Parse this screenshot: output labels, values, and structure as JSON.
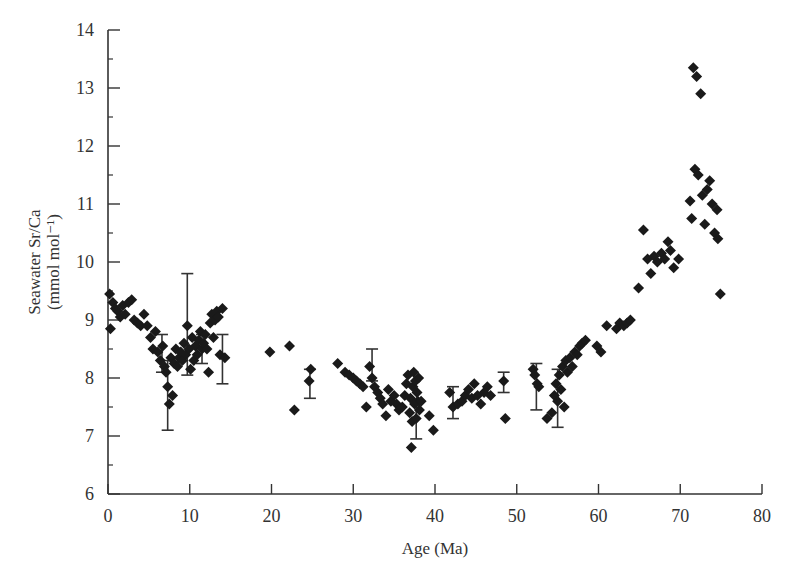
{
  "chart_data": {
    "type": "scatter",
    "title": "",
    "xlabel": "Age (Ma)",
    "ylabel_line1": "Seawater Sr/Ca",
    "ylabel_line2": "(mmol mol⁻¹)",
    "xlim": [
      0,
      80
    ],
    "ylim": [
      6,
      14
    ],
    "xticks": [
      0,
      10,
      20,
      30,
      40,
      50,
      60,
      70,
      80
    ],
    "yticks": [
      6,
      7,
      8,
      9,
      10,
      11,
      12,
      13,
      14
    ],
    "grid": false,
    "legend": null,
    "marker": "diamond",
    "marker_color": "#1a1a1a",
    "series": [
      {
        "name": "Seawater Sr/Ca",
        "points": [
          [
            0.2,
            9.45
          ],
          [
            0.3,
            8.85
          ],
          [
            0.6,
            9.3
          ],
          [
            0.9,
            9.2
          ],
          [
            1.2,
            9.15
          ],
          [
            1.5,
            9.05
          ],
          [
            1.8,
            9.25
          ],
          [
            2.1,
            9.1
          ],
          [
            2.5,
            9.3
          ],
          [
            2.9,
            9.35
          ],
          [
            3.2,
            9.0
          ],
          [
            3.6,
            8.95
          ],
          [
            4.0,
            8.9
          ],
          [
            4.4,
            9.1
          ],
          [
            4.8,
            8.9
          ],
          [
            5.2,
            8.7
          ],
          [
            5.5,
            8.5
          ],
          [
            5.8,
            8.8
          ],
          [
            6.1,
            8.45
          ],
          [
            6.4,
            8.3
          ],
          [
            6.7,
            8.55
          ],
          [
            6.9,
            8.2
          ],
          [
            7.1,
            8.1
          ],
          [
            7.3,
            7.85
          ],
          [
            7.5,
            7.55
          ],
          [
            7.7,
            8.35
          ],
          [
            7.9,
            7.7
          ],
          [
            8.1,
            8.25
          ],
          [
            8.3,
            8.5
          ],
          [
            8.5,
            8.2
          ],
          [
            8.7,
            8.35
          ],
          [
            8.9,
            8.45
          ],
          [
            9.1,
            8.3
          ],
          [
            9.3,
            8.6
          ],
          [
            9.5,
            8.4
          ],
          [
            9.7,
            8.9
          ],
          [
            9.9,
            8.5
          ],
          [
            10.1,
            8.15
          ],
          [
            10.3,
            8.7
          ],
          [
            10.5,
            8.3
          ],
          [
            10.7,
            8.55
          ],
          [
            10.9,
            8.4
          ],
          [
            11.1,
            8.65
          ],
          [
            11.3,
            8.8
          ],
          [
            11.5,
            8.5
          ],
          [
            11.7,
            8.6
          ],
          [
            11.9,
            8.75
          ],
          [
            12.1,
            8.5
          ],
          [
            12.3,
            8.1
          ],
          [
            12.5,
            8.95
          ],
          [
            12.7,
            9.1
          ],
          [
            12.9,
            8.7
          ],
          [
            13.1,
            9.0
          ],
          [
            13.3,
            9.15
          ],
          [
            13.5,
            9.05
          ],
          [
            13.7,
            8.4
          ],
          [
            14.0,
            9.2
          ],
          [
            14.3,
            8.35
          ],
          [
            19.8,
            8.45
          ],
          [
            22.2,
            8.55
          ],
          [
            22.8,
            7.45
          ],
          [
            24.6,
            7.95
          ],
          [
            24.8,
            8.15
          ],
          [
            28.1,
            8.25
          ],
          [
            29.0,
            8.1
          ],
          [
            29.5,
            8.05
          ],
          [
            30.0,
            8.0
          ],
          [
            30.4,
            7.95
          ],
          [
            30.8,
            7.9
          ],
          [
            31.2,
            7.85
          ],
          [
            31.6,
            7.5
          ],
          [
            32.0,
            8.2
          ],
          [
            32.3,
            8.0
          ],
          [
            32.6,
            7.85
          ],
          [
            33.0,
            7.75
          ],
          [
            33.3,
            7.65
          ],
          [
            33.6,
            7.55
          ],
          [
            34.0,
            7.35
          ],
          [
            34.3,
            7.8
          ],
          [
            34.6,
            7.6
          ],
          [
            35.0,
            7.7
          ],
          [
            35.3,
            7.55
          ],
          [
            35.6,
            7.45
          ],
          [
            36.0,
            7.5
          ],
          [
            36.3,
            7.7
          ],
          [
            36.5,
            7.9
          ],
          [
            36.7,
            8.05
          ],
          [
            36.9,
            7.4
          ],
          [
            37.0,
            7.65
          ],
          [
            37.1,
            6.8
          ],
          [
            37.2,
            7.25
          ],
          [
            37.3,
            7.85
          ],
          [
            37.4,
            8.1
          ],
          [
            37.5,
            7.55
          ],
          [
            37.6,
            7.95
          ],
          [
            37.7,
            7.3
          ],
          [
            37.8,
            7.75
          ],
          [
            37.9,
            7.6
          ],
          [
            38.0,
            8.0
          ],
          [
            38.1,
            7.45
          ],
          [
            38.3,
            7.6
          ],
          [
            39.3,
            7.35
          ],
          [
            39.8,
            7.1
          ],
          [
            41.8,
            7.75
          ],
          [
            42.2,
            7.5
          ],
          [
            42.8,
            7.55
          ],
          [
            43.3,
            7.6
          ],
          [
            43.7,
            7.7
          ],
          [
            44.1,
            7.8
          ],
          [
            44.5,
            7.65
          ],
          [
            44.8,
            7.9
          ],
          [
            45.2,
            7.7
          ],
          [
            45.6,
            7.55
          ],
          [
            46.0,
            7.75
          ],
          [
            46.4,
            7.85
          ],
          [
            46.8,
            7.7
          ],
          [
            48.4,
            7.95
          ],
          [
            48.6,
            7.3
          ],
          [
            52.0,
            8.15
          ],
          [
            52.2,
            8.05
          ],
          [
            52.5,
            7.9
          ],
          [
            52.7,
            7.85
          ],
          [
            53.7,
            7.3
          ],
          [
            54.3,
            7.4
          ],
          [
            54.6,
            7.7
          ],
          [
            54.8,
            7.9
          ],
          [
            55.0,
            7.6
          ],
          [
            55.2,
            8.05
          ],
          [
            55.4,
            7.8
          ],
          [
            55.6,
            8.2
          ],
          [
            55.8,
            7.5
          ],
          [
            56.0,
            8.3
          ],
          [
            56.2,
            8.1
          ],
          [
            56.5,
            8.35
          ],
          [
            56.8,
            8.2
          ],
          [
            57.1,
            8.45
          ],
          [
            57.4,
            8.4
          ],
          [
            57.7,
            8.55
          ],
          [
            58.0,
            8.6
          ],
          [
            58.4,
            8.65
          ],
          [
            59.8,
            8.55
          ],
          [
            60.3,
            8.45
          ],
          [
            61.0,
            8.9
          ],
          [
            62.2,
            8.85
          ],
          [
            62.6,
            8.95
          ],
          [
            63.1,
            8.9
          ],
          [
            63.5,
            8.95
          ],
          [
            63.9,
            9.0
          ],
          [
            64.9,
            9.55
          ],
          [
            65.5,
            10.55
          ],
          [
            66.0,
            10.05
          ],
          [
            66.4,
            9.8
          ],
          [
            66.8,
            10.1
          ],
          [
            67.2,
            10.0
          ],
          [
            67.7,
            10.15
          ],
          [
            68.1,
            10.05
          ],
          [
            68.5,
            10.35
          ],
          [
            68.8,
            10.2
          ],
          [
            69.2,
            9.9
          ],
          [
            69.8,
            10.05
          ],
          [
            71.2,
            11.05
          ],
          [
            71.4,
            10.75
          ],
          [
            71.6,
            13.35
          ],
          [
            71.8,
            11.6
          ],
          [
            72.0,
            13.2
          ],
          [
            72.2,
            11.5
          ],
          [
            72.5,
            12.9
          ],
          [
            72.7,
            11.15
          ],
          [
            73.0,
            10.65
          ],
          [
            73.3,
            11.25
          ],
          [
            73.6,
            11.4
          ],
          [
            73.9,
            11.0
          ],
          [
            74.2,
            10.5
          ],
          [
            74.5,
            10.9
          ],
          [
            74.6,
            10.4
          ],
          [
            74.9,
            9.45
          ]
        ]
      }
    ],
    "error_bars": [
      {
        "x": 6.6,
        "low": 8.1,
        "high": 8.75
      },
      {
        "x": 7.3,
        "low": 7.1,
        "high": 8.3
      },
      {
        "x": 9.7,
        "low": 8.05,
        "high": 9.8
      },
      {
        "x": 11.5,
        "low": 8.25,
        "high": 8.75
      },
      {
        "x": 14.0,
        "low": 7.9,
        "high": 8.75
      },
      {
        "x": 24.7,
        "low": 7.65,
        "high": 8.15
      },
      {
        "x": 32.3,
        "low": 7.95,
        "high": 8.5
      },
      {
        "x": 37.7,
        "low": 6.95,
        "high": 7.6
      },
      {
        "x": 42.2,
        "low": 7.3,
        "high": 7.85
      },
      {
        "x": 48.4,
        "low": 7.75,
        "high": 8.1
      },
      {
        "x": 52.4,
        "low": 7.45,
        "high": 8.25
      },
      {
        "x": 55.0,
        "low": 7.15,
        "high": 8.15
      }
    ]
  }
}
